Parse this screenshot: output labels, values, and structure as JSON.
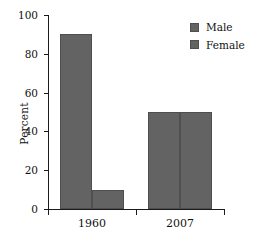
{
  "chart_data": {
    "type": "bar",
    "title": "",
    "subtitle": "",
    "xlabel": "",
    "ylabel": "Percent",
    "categories": [
      "1960",
      "2007"
    ],
    "series": [
      {
        "name": "Male",
        "values": [
          90,
          50
        ],
        "color": "#636363"
      },
      {
        "name": "Female",
        "values": [
          10,
          50
        ],
        "color": "#636363"
      }
    ],
    "ylim": [
      0,
      100
    ],
    "yticks": [
      0,
      20,
      40,
      60,
      80,
      100
    ],
    "ytick_labels": [
      "0",
      "20",
      "40",
      "60",
      "80",
      "100"
    ],
    "grid": false,
    "legend_position": "top-right",
    "annotations": []
  },
  "axes": {
    "y_title": "Percent",
    "y_tick_0": "0",
    "y_tick_20": "20",
    "y_tick_40": "40",
    "y_tick_60": "60",
    "y_tick_80": "80",
    "y_tick_100": "100",
    "x_tick_1": "1960",
    "x_tick_2": "2007"
  },
  "legend": {
    "items": [
      {
        "label": "Male",
        "swatch_color": "#636363"
      },
      {
        "label": "Female",
        "swatch_color": "#636363"
      }
    ]
  },
  "bars": [
    {
      "group": "1960",
      "series": "Male",
      "value": 90
    },
    {
      "group": "1960",
      "series": "Female",
      "value": 10
    },
    {
      "group": "2007",
      "series": "Male",
      "value": 50
    },
    {
      "group": "2007",
      "series": "Female",
      "value": 50
    }
  ]
}
